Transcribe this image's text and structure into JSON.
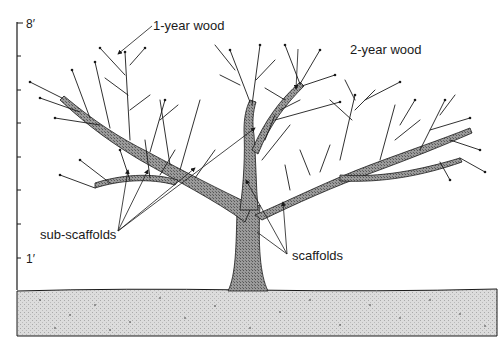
{
  "diagram": {
    "height_scale": {
      "top_label": "8′",
      "bottom_label": "1′",
      "tick_count": 8
    },
    "labels": {
      "one_year_wood": "1-year wood",
      "two_year_wood": "2-year wood",
      "sub_scaffolds": "sub-scaffolds",
      "scaffolds": "scaffolds"
    },
    "colors": {
      "ink": "#1a1a1a",
      "wood_fill": "#8a8a8a",
      "ground_fill": "#d9d9d9",
      "background": "#ffffff"
    }
  }
}
